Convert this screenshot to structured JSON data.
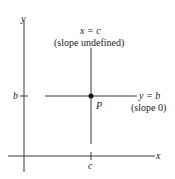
{
  "axes": {
    "x_label": "x",
    "y_label": "y"
  },
  "vertical_line": {
    "equation": "x = c",
    "note": "(slope undefined)"
  },
  "horizontal_line": {
    "equation": "y = b",
    "note": "(slope 0)"
  },
  "point": {
    "label": "P"
  },
  "ticks": {
    "x_tick": "c",
    "y_tick": "b"
  },
  "colors": {
    "line": "#3a3a3a",
    "point": "#111111"
  }
}
